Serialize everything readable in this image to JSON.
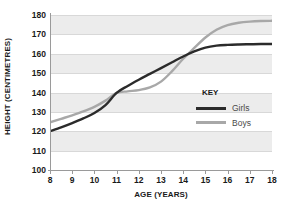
{
  "chart_data": {
    "type": "line",
    "title": "",
    "xlabel": "AGE (YEARS)",
    "ylabel": "HEIGHT (CENTIMETRES)",
    "xlim": [
      8,
      18
    ],
    "ylim": [
      100,
      180
    ],
    "xticks": [
      8,
      9,
      10,
      11,
      12,
      13,
      14,
      15,
      16,
      17,
      18
    ],
    "yticks": [
      100,
      110,
      120,
      130,
      140,
      150,
      160,
      170,
      180
    ],
    "grid": true,
    "banded_background": true,
    "legend_position": "inside-right",
    "legend_title": "KEY",
    "x": [
      8,
      8.5,
      9,
      9.5,
      10,
      10.5,
      11,
      11.5,
      12,
      12.5,
      13,
      13.5,
      14,
      14.5,
      15,
      15.5,
      16,
      16.5,
      17,
      17.5,
      18
    ],
    "series": [
      {
        "name": "Girls",
        "color": "#2b2b2b",
        "values": [
          120.0,
          122.0,
          124.2,
          126.6,
          129.4,
          133.5,
          139.8,
          143.4,
          146.6,
          149.6,
          152.6,
          155.6,
          158.6,
          161.2,
          163.2,
          164.2,
          164.6,
          164.8,
          164.9,
          165.0,
          165.0
        ]
      },
      {
        "name": "Boys",
        "color": "#a8a8a8",
        "values": [
          124.6,
          126.4,
          128.2,
          130.2,
          132.6,
          135.8,
          139.8,
          140.6,
          141.2,
          142.6,
          145.6,
          151.0,
          157.4,
          163.0,
          168.4,
          172.4,
          174.8,
          176.0,
          176.6,
          176.9,
          177.0
        ]
      }
    ]
  },
  "axes": {
    "y_title": "HEIGHT (CENTIMETRES)",
    "x_title": "AGE (YEARS)"
  },
  "legend": {
    "title": "KEY",
    "entries": [
      {
        "label": "Girls",
        "color": "#2b2b2b"
      },
      {
        "label": "Boys",
        "color": "#a8a8a8"
      }
    ]
  },
  "colors": {
    "girls_line": "#2b2b2b",
    "boys_line": "#a8a8a8",
    "band": "#ececec",
    "gridline": "#d8d8d8",
    "axis": "#9a9a9a",
    "text": "#1a1a1a",
    "legend_text": "#4a4a4a",
    "background": "#ffffff"
  }
}
